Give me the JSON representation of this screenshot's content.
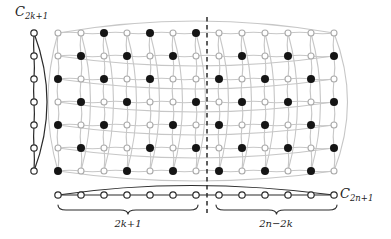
{
  "figure": {
    "background": "#ffffff",
    "colors": {
      "grid_line": "#c7c7c7",
      "grid_vertex_stroke": "#ababab",
      "vertex_fill": "#ffffff",
      "dark_line": "#2b2b2b",
      "black_vertex": "#151515",
      "text": "#1c1c1c"
    },
    "labels": {
      "left_cycle": {
        "base": "C",
        "subscript": "2k+1"
      },
      "bottom_cycle": {
        "base": "C",
        "subscript": "2n+1"
      },
      "left_brace": "2k+1",
      "right_brace": "2n−2k"
    },
    "grid": {
      "rows": 7,
      "cols": 13,
      "col_x": [
        58,
        81,
        104,
        127,
        150,
        173,
        196,
        219,
        242,
        265,
        288,
        311,
        334
      ],
      "row_y": [
        33,
        56,
        79,
        102,
        125,
        148,
        171
      ],
      "black_cells_by_row": [
        [
          3,
          5,
          7
        ],
        [
          2,
          4,
          6,
          9,
          11,
          13
        ],
        [
          1,
          3,
          5,
          8,
          10,
          12
        ],
        [
          2,
          4,
          7,
          9,
          11,
          13
        ],
        [
          1,
          3,
          6,
          8,
          10,
          12
        ],
        [
          2,
          5,
          7,
          9,
          11,
          13
        ],
        [
          1,
          4,
          6,
          8,
          10,
          12
        ]
      ],
      "black_vertex_count": 39
    },
    "left_cycle": {
      "x": 34,
      "vertex_count": 7
    },
    "bottom_cycle": {
      "y": 195,
      "vertex_count": 13
    },
    "dashed_line": {
      "x": 207,
      "y1": 17,
      "y2": 213
    },
    "braces": [
      {
        "x1": 58,
        "x2": 198,
        "y": 205
      },
      {
        "x1": 216,
        "x2": 337,
        "y": 205
      }
    ]
  }
}
